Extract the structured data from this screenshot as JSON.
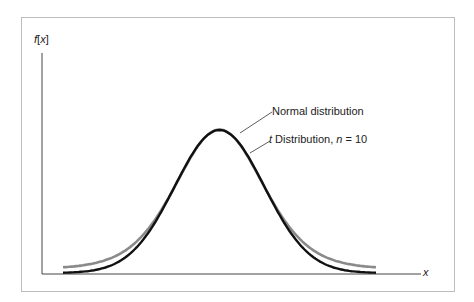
{
  "chart_data": {
    "type": "line",
    "title": "",
    "xlabel": "x",
    "ylabel": "f[x]",
    "grid": false,
    "legend_position": "annotations right of peak",
    "x_range": [
      -3.5,
      3.5
    ],
    "series": [
      {
        "name": "Normal distribution",
        "color": "#111111",
        "distribution": "normal",
        "mean": 0,
        "sd": 1,
        "peak_density": 0.399
      },
      {
        "name": "t Distribution, n = 10",
        "color": "#8a8a8a",
        "distribution": "student-t",
        "df": 10,
        "peak_density": 0.389
      }
    ],
    "annotations": [
      {
        "text": "Normal distribution",
        "points_to": "Normal distribution curve right shoulder"
      },
      {
        "text": "t Distribution, n = 10",
        "points_to": "t Distribution curve right shoulder"
      }
    ]
  },
  "labels": {
    "ylabel_f": "f",
    "ylabel_open": "[",
    "ylabel_x": "x",
    "ylabel_close": "]",
    "xlabel": "x",
    "normal": "Normal distribution",
    "t_prefix": "t",
    "t_mid": " Distribution, ",
    "t_n": "n",
    "t_suffix": " = 10"
  }
}
